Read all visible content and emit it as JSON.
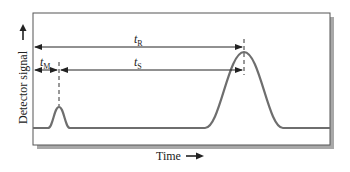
{
  "diagram": {
    "y_axis_label": "Detector signal",
    "x_axis_label": "Time",
    "annotations": {
      "retention_time": {
        "symbol": "t",
        "subscript": "R"
      },
      "dead_time": {
        "symbol": "t",
        "subscript": "M"
      },
      "adjusted_retention_time": {
        "symbol": "t",
        "subscript": "S"
      }
    },
    "peaks": [
      {
        "name": "unretained-peak",
        "position_x": 59,
        "height": "small"
      },
      {
        "name": "analyte-peak",
        "position_x": 244,
        "height": "large"
      }
    ],
    "colors": {
      "curve": "#6e6e6e",
      "frame": "#555555",
      "shadow": "#9a9a9a",
      "text": "#222222"
    }
  }
}
